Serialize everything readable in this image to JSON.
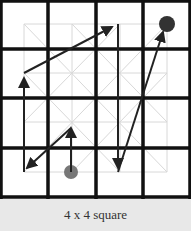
{
  "caption": "4 x 4 square",
  "grid": {
    "rows": 4,
    "cols": 4,
    "line_color": "#111111",
    "light_grid_color": "#d8d8d8"
  },
  "markers": {
    "start": {
      "cell": [
        1,
        3
      ],
      "color": "#777777"
    },
    "end": {
      "cell": [
        3,
        0
      ],
      "color": "#333333"
    }
  },
  "path": [
    {
      "from": [
        1,
        3
      ],
      "to": [
        1,
        2
      ]
    },
    {
      "from": [
        1,
        2
      ],
      "to": [
        0,
        3
      ]
    },
    {
      "from": [
        0,
        3
      ],
      "to": [
        0,
        1
      ]
    },
    {
      "from": [
        0,
        1
      ],
      "to": [
        2,
        0
      ]
    },
    {
      "from": [
        2,
        0
      ],
      "to": [
        2,
        3
      ]
    },
    {
      "from": [
        2,
        3
      ],
      "to": [
        3,
        0
      ]
    }
  ]
}
